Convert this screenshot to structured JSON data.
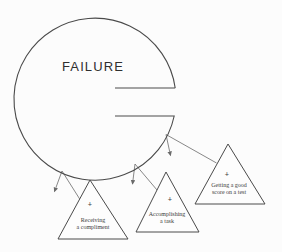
{
  "diagram": {
    "failure_label": "FAILURE",
    "plus_symbol": "+",
    "triangles": [
      {
        "line1": "Receiving",
        "line2": "a compliment"
      },
      {
        "line1": "Accomplishing",
        "line2": "a task"
      },
      {
        "line1": "Getting a good",
        "line2": "score on a test"
      }
    ],
    "colors": {
      "line": "#4a4a4a",
      "arrow": "#6a6a6a",
      "label": "#3c3c3c",
      "title": "#2f2f2f",
      "background": "#fcfcfc"
    }
  }
}
